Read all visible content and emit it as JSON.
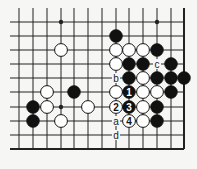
{
  "diagram": {
    "type": "go-board-fragment",
    "columns": 13,
    "rows": 10,
    "col_x": [
      19,
      33,
      47,
      61,
      74,
      88,
      102,
      116,
      129,
      143,
      157,
      171,
      184
    ],
    "row_y": [
      22,
      36,
      50,
      64,
      78,
      92,
      107,
      121,
      135,
      149
    ],
    "grid_top": 8,
    "bottom_edge_row": 9,
    "right_edge_col": 12,
    "colors": {
      "line": "#222222",
      "black_stone": "#111111",
      "white_stone": "#ffffff",
      "background": "#f6f6f4"
    },
    "star_points": [
      [
        3,
        0
      ],
      [
        10,
        0
      ],
      [
        3,
        6
      ]
    ],
    "stones": [
      {
        "col": 7,
        "row": 1,
        "color": "black"
      },
      {
        "col": 3,
        "row": 2,
        "color": "white"
      },
      {
        "col": 7,
        "row": 2,
        "color": "white"
      },
      {
        "col": 8,
        "row": 2,
        "color": "white"
      },
      {
        "col": 9,
        "row": 2,
        "color": "white"
      },
      {
        "col": 10,
        "row": 2,
        "color": "black"
      },
      {
        "col": 7,
        "row": 3,
        "color": "white"
      },
      {
        "col": 8,
        "row": 3,
        "color": "black"
      },
      {
        "col": 9,
        "row": 3,
        "color": "black"
      },
      {
        "col": 11,
        "row": 3,
        "color": "black"
      },
      {
        "col": 8,
        "row": 4,
        "color": "black"
      },
      {
        "col": 9,
        "row": 4,
        "color": "white"
      },
      {
        "col": 10,
        "row": 4,
        "color": "black"
      },
      {
        "col": 11,
        "row": 4,
        "color": "black"
      },
      {
        "col": 12,
        "row": 4,
        "color": "black"
      },
      {
        "col": 2,
        "row": 5,
        "color": "white"
      },
      {
        "col": 4,
        "row": 5,
        "color": "black"
      },
      {
        "col": 7,
        "row": 5,
        "color": "white"
      },
      {
        "col": 8,
        "row": 5,
        "color": "black",
        "label": "1"
      },
      {
        "col": 9,
        "row": 5,
        "color": "white"
      },
      {
        "col": 10,
        "row": 5,
        "color": "white"
      },
      {
        "col": 11,
        "row": 5,
        "color": "black"
      },
      {
        "col": 1,
        "row": 6,
        "color": "black"
      },
      {
        "col": 2,
        "row": 6,
        "color": "white"
      },
      {
        "col": 5,
        "row": 6,
        "color": "white"
      },
      {
        "col": 7,
        "row": 6,
        "color": "white",
        "label": "2"
      },
      {
        "col": 8,
        "row": 6,
        "color": "black",
        "label": "3"
      },
      {
        "col": 9,
        "row": 6,
        "color": "white"
      },
      {
        "col": 10,
        "row": 6,
        "color": "black"
      },
      {
        "col": 1,
        "row": 7,
        "color": "black"
      },
      {
        "col": 3,
        "row": 7,
        "color": "white"
      },
      {
        "col": 8,
        "row": 7,
        "color": "white",
        "label": "4"
      },
      {
        "col": 9,
        "row": 7,
        "color": "white"
      },
      {
        "col": 10,
        "row": 7,
        "color": "black"
      }
    ],
    "point_labels": [
      {
        "col": 10,
        "row": 3,
        "text": "c"
      },
      {
        "col": 7,
        "row": 4,
        "text": "b"
      },
      {
        "col": 7,
        "row": 7,
        "text": "a"
      },
      {
        "col": 7,
        "row": 8,
        "text": "d"
      }
    ]
  }
}
